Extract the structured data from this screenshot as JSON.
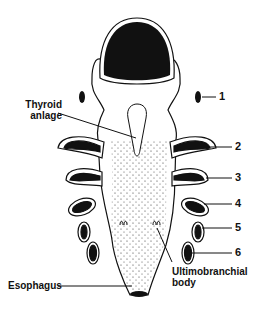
{
  "figure": {
    "type": "anatomical diagram",
    "labels": {
      "thyroid_line1": "Thyroid",
      "thyroid_line2": "anlage",
      "esophagus": "Esophagus",
      "ultimo_line1": "Ultimobranchial",
      "ultimo_line2": "body"
    },
    "pouch_numbers": [
      "1",
      "2",
      "3",
      "4",
      "5",
      "6"
    ],
    "colors": {
      "ink": "#111111",
      "fill": "#ffffff"
    }
  }
}
